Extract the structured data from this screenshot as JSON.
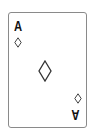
{
  "card": {
    "rank": "A",
    "suit": "diamonds",
    "suit_icon": "diamond-outline-icon",
    "colors": {
      "border": "#8a8a8a",
      "ink": "#111111",
      "background": "#ffffff"
    }
  }
}
